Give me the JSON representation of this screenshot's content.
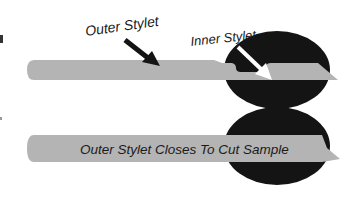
{
  "diagram": {
    "labels": {
      "outer_stylet": "Outer Stylet",
      "inner_stylet": "Inner Stylet",
      "caption": "Outer Stylet Closes To Cut Sample"
    },
    "colors": {
      "needle": "#b4b4b4",
      "tissue": "#141414",
      "outer_arrow": "#141414",
      "inner_arrow": "#ffffff",
      "text": "#1a1a1a",
      "background": "#ffffff"
    },
    "panels": [
      {
        "name": "open",
        "state": "inner stylet extended into tissue with sample notch exposed"
      },
      {
        "name": "closed",
        "state": "outer stylet advanced over inner stylet cutting sample"
      }
    ]
  }
}
